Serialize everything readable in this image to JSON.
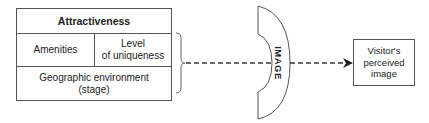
{
  "attractiveness_table": {
    "title": "Attractiveness",
    "cells": {
      "amenities": "Amenities",
      "uniqueness_line1": "Level",
      "uniqueness_line2": "of uniqueness",
      "geo_line1": "Geographic environment",
      "geo_line2": "(stage)"
    }
  },
  "lens": {
    "label": "IMAGE"
  },
  "result_box": {
    "line1": "Visitor's",
    "line2": "perceived",
    "line3": "image"
  },
  "colors": {
    "stroke": "#555555",
    "text": "#222222"
  }
}
